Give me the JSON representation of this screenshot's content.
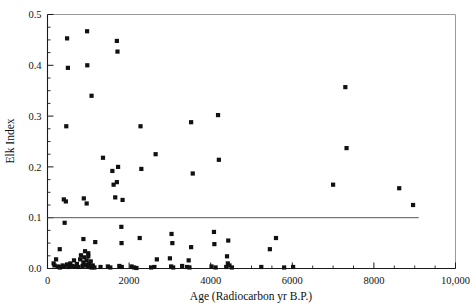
{
  "chart_data": {
    "type": "scatter",
    "title": "",
    "xlabel": "Age (Radiocarbon yr B.P.)",
    "ylabel": "Elk Index",
    "xlim": [
      0,
      10000
    ],
    "ylim": [
      0.0,
      0.5
    ],
    "grid": false,
    "legend": null,
    "xticks": [
      0,
      2000,
      4000,
      6000,
      8000,
      10000
    ],
    "xticklabels": [
      "0",
      "2000",
      "4000",
      "6000",
      "8000",
      "10,000"
    ],
    "xtick_minor_step": 500,
    "yticks": [
      0.0,
      0.1,
      0.2,
      0.3,
      0.4,
      0.5
    ],
    "yticklabels": [
      "0.0",
      "0.1",
      "0.2",
      "0.3",
      "0.4",
      "0.5"
    ],
    "ytick_minor_step": 0.025,
    "marker": "square",
    "marker_color": "#111111",
    "marker_size_px": 4.2,
    "annotations": [
      {
        "type": "reference-line",
        "orientation": "horizontal",
        "y": 0.1,
        "x_start": 0,
        "x_end": 9100,
        "color": "#555555"
      }
    ],
    "points": [
      [
        480,
        0.453
      ],
      [
        970,
        0.467
      ],
      [
        500,
        0.395
      ],
      [
        975,
        0.4
      ],
      [
        1080,
        0.34
      ],
      [
        1700,
        0.448
      ],
      [
        1715,
        0.427
      ],
      [
        460,
        0.28
      ],
      [
        1730,
        0.2
      ],
      [
        1360,
        0.218
      ],
      [
        1590,
        0.192
      ],
      [
        1700,
        0.17
      ],
      [
        1620,
        0.165
      ],
      [
        2280,
        0.28
      ],
      [
        2300,
        0.196
      ],
      [
        2650,
        0.225
      ],
      [
        3520,
        0.288
      ],
      [
        3560,
        0.187
      ],
      [
        4180,
        0.302
      ],
      [
        4200,
        0.214
      ],
      [
        7300,
        0.357
      ],
      [
        7330,
        0.237
      ],
      [
        7000,
        0.165
      ],
      [
        8620,
        0.158
      ],
      [
        8960,
        0.125
      ],
      [
        400,
        0.136
      ],
      [
        450,
        0.132
      ],
      [
        890,
        0.138
      ],
      [
        960,
        0.128
      ],
      [
        1660,
        0.14
      ],
      [
        1840,
        0.135
      ],
      [
        420,
        0.09
      ],
      [
        1810,
        0.082
      ],
      [
        1815,
        0.05
      ],
      [
        880,
        0.058
      ],
      [
        1170,
        0.052
      ],
      [
        300,
        0.038
      ],
      [
        1000,
        0.03
      ],
      [
        2260,
        0.06
      ],
      [
        3040,
        0.068
      ],
      [
        3060,
        0.05
      ],
      [
        3520,
        0.042
      ],
      [
        4080,
        0.072
      ],
      [
        4090,
        0.048
      ],
      [
        4430,
        0.055
      ],
      [
        5450,
        0.038
      ],
      [
        2680,
        0.018
      ],
      [
        3000,
        0.02
      ],
      [
        3460,
        0.016
      ],
      [
        4400,
        0.024
      ],
      [
        4420,
        0.01
      ],
      [
        5600,
        0.06
      ],
      [
        150,
        0.01
      ],
      [
        170,
        0.006
      ],
      [
        210,
        0.018
      ],
      [
        250,
        0.004
      ],
      [
        300,
        0.002
      ],
      [
        330,
        0.003
      ],
      [
        370,
        0.006
      ],
      [
        420,
        0.004
      ],
      [
        480,
        0.008
      ],
      [
        520,
        0.003
      ],
      [
        560,
        0.01
      ],
      [
        600,
        0.005
      ],
      [
        650,
        0.016
      ],
      [
        680,
        0.004
      ],
      [
        720,
        0.009
      ],
      [
        760,
        0.003
      ],
      [
        800,
        0.018
      ],
      [
        820,
        0.026
      ],
      [
        860,
        0.005
      ],
      [
        880,
        0.012
      ],
      [
        900,
        0.022
      ],
      [
        920,
        0.034
      ],
      [
        940,
        0.007
      ],
      [
        960,
        0.016
      ],
      [
        980,
        0.004
      ],
      [
        1000,
        0.024
      ],
      [
        1020,
        0.009
      ],
      [
        1040,
        0.003
      ],
      [
        1060,
        0.014
      ],
      [
        1080,
        0.002
      ],
      [
        1110,
        0.006
      ],
      [
        1150,
        0.002
      ],
      [
        1300,
        0.003
      ],
      [
        1480,
        0.004
      ],
      [
        1540,
        0.002
      ],
      [
        1760,
        0.005
      ],
      [
        1820,
        0.003
      ],
      [
        2060,
        0.004
      ],
      [
        2120,
        0.002
      ],
      [
        2180,
        0.001
      ],
      [
        2540,
        0.002
      ],
      [
        2620,
        0.003
      ],
      [
        3030,
        0.004
      ],
      [
        3080,
        0.002
      ],
      [
        3300,
        0.005
      ],
      [
        3420,
        0.003
      ],
      [
        3480,
        0.002
      ],
      [
        4020,
        0.004
      ],
      [
        4120,
        0.002
      ],
      [
        4380,
        0.003
      ],
      [
        4460,
        0.006
      ],
      [
        4520,
        0.002
      ],
      [
        5240,
        0.003
      ],
      [
        5800,
        0.002
      ],
      [
        6020,
        0.003
      ]
    ]
  }
}
